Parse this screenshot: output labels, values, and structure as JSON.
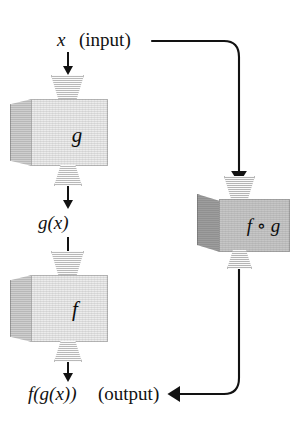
{
  "diagram": {
    "background": "#ffffff",
    "ink": "#121212"
  },
  "labels": {
    "input_var": "x",
    "input_word": "(input)",
    "intermediate": "g(x)",
    "output_expr": "f(g(x))",
    "output_word": "(output)"
  },
  "machines": [
    {
      "id": "machine-g",
      "label": "g",
      "front_color": "#ececec",
      "side_color": "#cfcfcf"
    },
    {
      "id": "machine-f",
      "label": "f",
      "front_color": "#ececec",
      "side_color": "#cfcfcf"
    },
    {
      "id": "machine-fog",
      "label": "f ∘ g",
      "front_color": "#c6c6c6",
      "side_color": "#9d9d9d"
    }
  ],
  "funnels": {
    "intake_color": "#e4e4e4",
    "outlet_color": "#e4e4e4"
  },
  "connectors": [
    {
      "id": "arrow-input-to-g",
      "kind": "straight-down"
    },
    {
      "id": "arrow-g-to-gx",
      "kind": "straight-down"
    },
    {
      "id": "arrow-gx-to-f",
      "kind": "straight-down"
    },
    {
      "id": "arrow-f-to-output",
      "kind": "straight-down"
    },
    {
      "id": "wire-input-to-fog",
      "kind": "elbow-right-down"
    },
    {
      "id": "wire-fog-to-output",
      "kind": "elbow-down-left"
    }
  ]
}
